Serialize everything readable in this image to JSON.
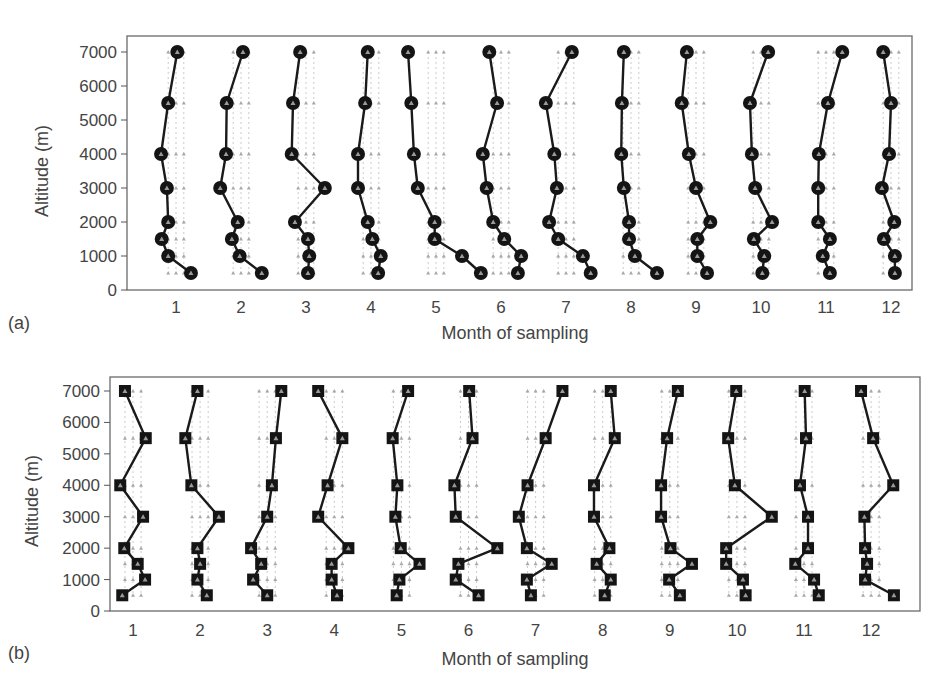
{
  "figure": {
    "panels": [
      {
        "id": "a",
        "label": "(a)",
        "marker": "circle"
      },
      {
        "id": "b",
        "label": "(b)",
        "marker": "square"
      }
    ]
  },
  "chart_data": [
    {
      "type": "line",
      "panel_label": "(a)",
      "title": "",
      "xlabel": "Month of sampling",
      "ylabel": "Altitude (m)",
      "ylim": [
        0,
        7000
      ],
      "yticks": [
        0,
        1000,
        2000,
        3000,
        4000,
        5000,
        6000,
        7000
      ],
      "xticks": [
        "1",
        "2",
        "3",
        "4",
        "5",
        "6",
        "7",
        "8",
        "9",
        "10",
        "11",
        "12"
      ],
      "marker": "filled circle",
      "grid": false,
      "altitudes": [
        7000,
        5500,
        4000,
        3000,
        2000,
        1500,
        1000,
        500
      ],
      "note": "Each month shows a vertical profile; x value = month position + relative deviation (in month units)",
      "series": [
        {
          "name": "1",
          "x": [
            1.02,
            0.88,
            0.77,
            0.86,
            0.88,
            0.78,
            0.88,
            1.23
          ]
        },
        {
          "name": "2",
          "x": [
            2.03,
            1.78,
            1.77,
            1.68,
            1.95,
            1.86,
            1.98,
            2.32
          ]
        },
        {
          "name": "3",
          "x": [
            2.91,
            2.8,
            2.78,
            3.29,
            2.83,
            3.03,
            3.05,
            3.03
          ]
        },
        {
          "name": "4",
          "x": [
            3.95,
            3.91,
            3.8,
            3.8,
            3.95,
            4.02,
            4.15,
            4.11
          ]
        },
        {
          "name": "5",
          "x": [
            4.57,
            4.62,
            4.66,
            4.72,
            4.98,
            4.98,
            5.4,
            5.69
          ]
        },
        {
          "name": "6",
          "x": [
            5.82,
            5.94,
            5.72,
            5.78,
            5.88,
            6.05,
            6.31,
            6.26
          ]
        },
        {
          "name": "7",
          "x": [
            7.09,
            6.69,
            6.82,
            6.86,
            6.74,
            6.88,
            7.26,
            7.38
          ]
        },
        {
          "name": "8",
          "x": [
            7.89,
            7.86,
            7.85,
            7.89,
            7.97,
            7.97,
            8.06,
            8.4
          ]
        },
        {
          "name": "9",
          "x": [
            8.86,
            8.78,
            8.89,
            9.0,
            9.22,
            9.02,
            9.02,
            9.17
          ]
        },
        {
          "name": "10",
          "x": [
            10.11,
            9.83,
            9.86,
            9.91,
            10.17,
            9.89,
            10.05,
            10.02
          ]
        },
        {
          "name": "11",
          "x": [
            11.25,
            11.03,
            10.89,
            10.88,
            10.88,
            11.06,
            10.95,
            11.06
          ]
        },
        {
          "name": "12",
          "x": [
            11.88,
            12.0,
            11.97,
            11.86,
            12.05,
            11.89,
            12.06,
            12.06
          ]
        }
      ]
    },
    {
      "type": "line",
      "panel_label": "(b)",
      "title": "",
      "xlabel": "Month of sampling",
      "ylabel": "Altitude (m)",
      "ylim": [
        0,
        7000
      ],
      "yticks": [
        0,
        1000,
        2000,
        3000,
        4000,
        5000,
        6000,
        7000
      ],
      "xticks": [
        "1",
        "2",
        "3",
        "4",
        "5",
        "6",
        "7",
        "8",
        "9",
        "10",
        "11",
        "12"
      ],
      "marker": "filled square",
      "grid": false,
      "altitudes": [
        7000,
        5500,
        4000,
        3000,
        2000,
        1500,
        1000,
        500
      ],
      "note": "Each month shows a vertical profile; x value = month position + relative deviation (in month units)",
      "series": [
        {
          "name": "1",
          "x": [
            0.88,
            1.19,
            0.81,
            1.15,
            0.87,
            1.07,
            1.18,
            0.84
          ]
        },
        {
          "name": "2",
          "x": [
            1.96,
            1.78,
            1.87,
            2.28,
            1.96,
            2.0,
            1.96,
            2.1
          ]
        },
        {
          "name": "3",
          "x": [
            3.21,
            3.13,
            3.07,
            3.0,
            2.76,
            2.91,
            2.79,
            3.0
          ]
        },
        {
          "name": "4",
          "x": [
            3.76,
            4.12,
            3.9,
            3.76,
            4.21,
            3.96,
            3.96,
            4.04
          ]
        },
        {
          "name": "5",
          "x": [
            5.1,
            4.87,
            4.94,
            4.91,
            4.99,
            5.27,
            4.97,
            4.93
          ]
        },
        {
          "name": "6",
          "x": [
            6.01,
            6.06,
            5.79,
            5.81,
            6.43,
            5.85,
            5.81,
            6.15
          ]
        },
        {
          "name": "7",
          "x": [
            7.4,
            7.15,
            6.88,
            6.75,
            6.87,
            7.24,
            6.87,
            6.93
          ]
        },
        {
          "name": "8",
          "x": [
            8.12,
            8.18,
            7.87,
            7.87,
            8.1,
            7.91,
            8.12,
            8.03
          ]
        },
        {
          "name": "9",
          "x": [
            9.12,
            8.96,
            8.87,
            8.87,
            9.01,
            9.33,
            8.99,
            9.15
          ]
        },
        {
          "name": "10",
          "x": [
            9.99,
            9.87,
            9.97,
            10.52,
            9.84,
            9.84,
            10.09,
            10.13
          ]
        },
        {
          "name": "11",
          "x": [
            11.01,
            11.03,
            10.94,
            11.06,
            11.06,
            10.87,
            11.15,
            11.22
          ]
        },
        {
          "name": "12",
          "x": [
            11.85,
            12.03,
            12.33,
            11.9,
            11.91,
            11.94,
            11.91,
            12.34
          ]
        }
      ]
    }
  ]
}
